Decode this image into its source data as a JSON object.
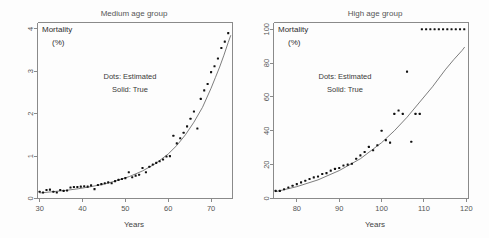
{
  "figure": {
    "width": 489,
    "height": 238,
    "background": "#fdfdfd",
    "ink_color": "#111111",
    "curve_color": "#6e6e6e",
    "axis_color": "#8a8a8a"
  },
  "panels": [
    {
      "id": "medium-age-group",
      "title": "Medium age group",
      "ylabel_line1": "Mortality",
      "ylabel_line2": "(%)",
      "xlabel": "Years",
      "annotation_line1": "Dots: Estimated",
      "annotation_line2": "Solid: True"
    },
    {
      "id": "high-age-group",
      "title": "High age group",
      "ylabel_line1": "Mortality",
      "ylabel_line2": "(%)",
      "xlabel": "Years",
      "annotation_line1": "Dots: Estimated",
      "annotation_line2": "Solid: True"
    }
  ],
  "chart_data": [
    {
      "type": "scatter",
      "title": "Medium age group",
      "xlabel": "Years",
      "ylabel": "Mortality (%)",
      "xlim": [
        29.5,
        75.0
      ],
      "ylim": [
        0,
        4.15
      ],
      "xticks": [
        30,
        40,
        50,
        60,
        70
      ],
      "yticks": [
        0,
        1,
        2,
        3,
        4
      ],
      "grid": false,
      "legend": [
        "Dots: Estimated",
        "Solid: True"
      ],
      "legend_position": "inside-center",
      "annotations": [
        "Dots: Estimated",
        "Solid: True"
      ],
      "series": [
        {
          "name": "Estimated",
          "marker": "dot",
          "x": [
            30.0,
            30.8,
            31.6,
            32.4,
            33.2,
            34.0,
            34.8,
            35.6,
            36.4,
            37.2,
            38.0,
            38.8,
            39.6,
            40.4,
            41.2,
            42.0,
            42.8,
            43.6,
            44.4,
            45.2,
            46.0,
            46.8,
            47.6,
            48.4,
            49.2,
            50.0,
            50.8,
            51.6,
            52.4,
            53.2,
            54.0,
            54.8,
            55.6,
            56.4,
            57.2,
            58.0,
            58.8,
            59.6,
            60.4,
            61.2,
            62.0,
            62.8,
            63.6,
            64.4,
            65.2,
            66.0,
            66.8,
            67.6,
            68.4,
            69.2,
            70.0,
            70.8,
            71.6,
            72.4,
            73.2,
            74.0
          ],
          "y": [
            0.16,
            0.14,
            0.2,
            0.21,
            0.16,
            0.14,
            0.2,
            0.18,
            0.19,
            0.26,
            0.27,
            0.27,
            0.28,
            0.29,
            0.28,
            0.31,
            0.22,
            0.32,
            0.34,
            0.36,
            0.38,
            0.36,
            0.41,
            0.44,
            0.46,
            0.48,
            0.62,
            0.5,
            0.54,
            0.56,
            0.72,
            0.62,
            0.75,
            0.8,
            0.84,
            0.88,
            0.92,
            0.99,
            1.0,
            1.48,
            1.3,
            1.42,
            1.55,
            1.7,
            1.88,
            2.05,
            1.65,
            2.35,
            2.55,
            2.7,
            2.98,
            3.12,
            3.3,
            3.55,
            3.7,
            3.9
          ]
        },
        {
          "name": "True",
          "marker": "line",
          "x": [
            30,
            33,
            36,
            39,
            42,
            45,
            48,
            51,
            54,
            57,
            60,
            62,
            64,
            66,
            68,
            70,
            71,
            72,
            73,
            74,
            74.6
          ],
          "y": [
            0.13,
            0.16,
            0.19,
            0.23,
            0.28,
            0.34,
            0.42,
            0.52,
            0.65,
            0.82,
            1.05,
            1.25,
            1.5,
            1.8,
            2.15,
            2.6,
            2.85,
            3.1,
            3.38,
            3.68,
            3.85
          ]
        }
      ]
    },
    {
      "type": "scatter",
      "title": "High age group",
      "xlabel": "Years",
      "ylabel": "Mortality (%)",
      "xlim": [
        74.5,
        120.5
      ],
      "ylim": [
        0,
        104
      ],
      "xticks": [
        80,
        90,
        100,
        110,
        120
      ],
      "yticks": [
        0,
        20,
        40,
        60,
        80,
        100
      ],
      "grid": false,
      "legend": [
        "Dots: Estimated",
        "Solid: True"
      ],
      "legend_position": "inside-center",
      "annotations": [
        "Dots: Estimated",
        "Solid: True"
      ],
      "series": [
        {
          "name": "Estimated",
          "marker": "dot",
          "x": [
            75.0,
            76.0,
            77.0,
            78.0,
            79.0,
            80.0,
            81.0,
            82.0,
            83.0,
            84.0,
            85.0,
            86.0,
            87.0,
            88.0,
            89.0,
            90.0,
            91.0,
            92.0,
            93.0,
            94.0,
            95.0,
            96.0,
            97.0,
            98.0,
            99.0,
            100.0,
            101.0,
            102.0,
            103.0,
            104.0,
            105.0,
            106.0,
            107.0,
            108.0,
            109.0
          ],
          "y": [
            4.5,
            4.5,
            5.5,
            6.5,
            7.5,
            8.5,
            9.5,
            10.5,
            11.5,
            12.5,
            13.0,
            14.5,
            15.0,
            16.5,
            17.5,
            18.0,
            19.5,
            20.0,
            20.5,
            23.5,
            25.5,
            27.5,
            30.5,
            28.5,
            31.5,
            40.0,
            34.5,
            33.0,
            50.0,
            52.0,
            50.0,
            75.0,
            33.5,
            50.0,
            50.0
          ]
        },
        {
          "name": "Saturated",
          "marker": "dot",
          "x": [
            109.5,
            110.5,
            111.5,
            112.5,
            113.5,
            114.5,
            115.5,
            116.5,
            117.5,
            118.5,
            119.5
          ],
          "y": [
            100,
            100,
            100,
            100,
            100,
            100,
            100,
            100,
            100,
            100,
            100
          ]
        },
        {
          "name": "True",
          "marker": "line",
          "x": [
            75,
            80,
            85,
            90,
            95,
            100,
            103,
            106,
            109,
            112,
            115,
            117,
            119,
            119.6
          ],
          "y": [
            4.0,
            7.0,
            11.0,
            16.5,
            23.5,
            33.0,
            40.0,
            48.0,
            57.0,
            66.0,
            76.0,
            82.0,
            87.5,
            89.5
          ]
        }
      ]
    }
  ]
}
